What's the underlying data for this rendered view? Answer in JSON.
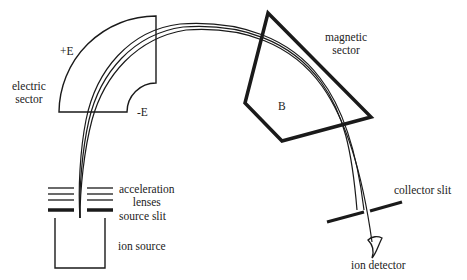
{
  "labels": {
    "electric_sector": [
      "electric",
      "sector"
    ],
    "plus_e": "+E",
    "minus_e": "-E",
    "magnetic_sector": [
      "magnetic",
      "sector"
    ],
    "b_field": "B",
    "acceleration_lenses": [
      "acceleration",
      "lenses"
    ],
    "source_slit": "source slit",
    "ion_source": "ion source",
    "collector_slit": "collector slit",
    "ion_detector": "ion detector"
  },
  "colors": {
    "stroke": "#1a1a1a",
    "background": "#ffffff",
    "text": "#222222"
  }
}
